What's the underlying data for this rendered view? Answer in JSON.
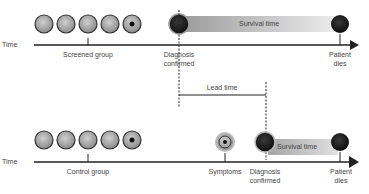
{
  "diagram": {
    "screened": {
      "axis_label": "Time",
      "group_label": "Screened group",
      "event_diagnosis": "Diagnosis\nconfirmed",
      "event_diagnosis_line1": "Diagnosis",
      "event_diagnosis_line2": "confirmed",
      "event_death_line1": "Patient",
      "event_death_line2": "dies",
      "bar_label": "Survival time"
    },
    "lead": {
      "label": "Lead time"
    },
    "control": {
      "axis_label": "Time",
      "group_label": "Control group",
      "event_symptoms": "Symptoms",
      "event_diagnosis_line1": "Diagnosis",
      "event_diagnosis_line2": "confirmed",
      "event_death_line1": "Patient",
      "event_death_line2": "dies",
      "bar_label": "Survival time"
    },
    "colors": {
      "axis": "#222222",
      "cell_fill": "#a8a8a8",
      "cell_dark": "#1a1a1a",
      "bar_start": "#a0a0a0",
      "bar_end": "#ececec"
    }
  }
}
